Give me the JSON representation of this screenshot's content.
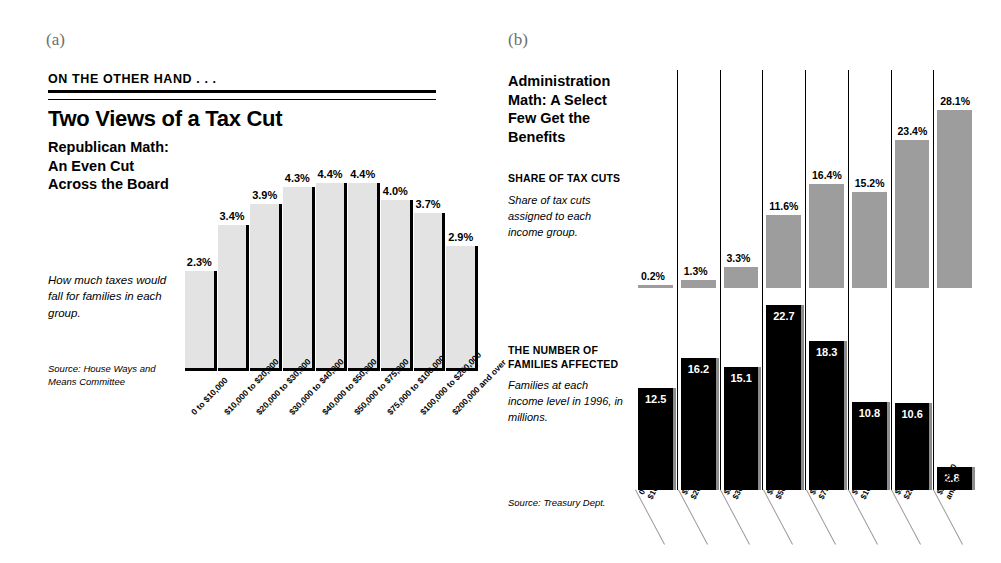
{
  "figure_labels": {
    "a": "(a)",
    "b": "(b)"
  },
  "panel_a": {
    "kicker": "ON THE OTHER HAND . . .",
    "title": "Two Views of a Tax Cut",
    "subhead": "Republican Math: An Even Cut Across the Board",
    "blurb": "How much taxes would fall for families in each group.",
    "source": "Source: House Ways and Means Committee"
  },
  "panel_b": {
    "title": "Administration Math: A Select Few Get the Benefits",
    "share_label": "SHARE OF TAX CUTS",
    "share_blurb": "Share of tax cuts assigned to each income group.",
    "families_label": "THE NUMBER OF FAMILIES AFFECTED",
    "families_blurb": "Families at each income level in 1996, in millions.",
    "source": "Source: Treasury Dept."
  },
  "chart_data": [
    {
      "type": "bar",
      "title": "Republican Math: An Even Cut Across the Board",
      "xlabel": "",
      "ylabel": "",
      "ylim": [
        0,
        5
      ],
      "grid": false,
      "legend": "none",
      "categories": [
        "0 to $10,000",
        "$10,000 to $20,000",
        "$20,000 to $30,000",
        "$30,000 to $40,000",
        "$40,000 to $50,000",
        "$50,000 to $75,000",
        "$75,000 to $100,000",
        "$100,000 to $200,000",
        "$200,000 and over"
      ],
      "values": [
        2.3,
        3.4,
        3.9,
        4.3,
        4.4,
        4.4,
        4.0,
        3.7,
        2.9
      ],
      "value_labels": [
        "2.3%",
        "3.4%",
        "3.9%",
        "4.3%",
        "4.4%",
        "4.4%",
        "4.0%",
        "3.7%",
        "2.9%"
      ],
      "bar_color": "#e3e3e3"
    },
    {
      "type": "bar",
      "title": "Administration Math: A Select Few Get the Benefits",
      "xlabel": "",
      "ylabel": "",
      "grid": false,
      "legend": "none",
      "categories": [
        "0 to $10,000",
        "$10,000 to $20,000",
        "$20,000 to $30,000",
        "$30,000 to $50,000",
        "$50,000 to $75,000",
        "$75,000 to $100,000",
        "$100,000 to $200,000",
        "$200,000 and over"
      ],
      "category_lines": [
        [
          "0 to",
          "$10,000"
        ],
        [
          "$10,000 to",
          "$20,000"
        ],
        [
          "$20,000 to",
          "$30,000"
        ],
        [
          "$30,000 to",
          "$50,000"
        ],
        [
          "$50,000 to",
          "$75,000"
        ],
        [
          "$75,000 to",
          "$100,000"
        ],
        [
          "$100,000 to",
          "$200,000"
        ],
        [
          "$200,000",
          "and over"
        ]
      ],
      "series": [
        {
          "name": "SHARE OF TAX CUTS",
          "unit": "percent",
          "orientation": "hanging-from-top",
          "values": [
            0.2,
            1.3,
            3.3,
            11.6,
            16.4,
            15.2,
            23.4,
            28.1
          ],
          "value_labels": [
            "0.2%",
            "1.3%",
            "3.3%",
            "11.6%",
            "16.4%",
            "15.2%",
            "23.4%",
            "28.1%"
          ],
          "ylim": [
            0,
            30
          ],
          "color": "#9d9d9d"
        },
        {
          "name": "THE NUMBER OF FAMILIES AFFECTED",
          "unit": "millions",
          "orientation": "rising-from-bottom",
          "values": [
            12.5,
            16.2,
            15.1,
            22.7,
            18.3,
            10.8,
            10.6,
            2.8
          ],
          "value_labels": [
            "12.5",
            "16.2",
            "15.1",
            "22.7",
            "18.3",
            "10.8",
            "10.6",
            "2.8"
          ],
          "ylim": [
            0,
            24
          ],
          "color": "#000000"
        }
      ]
    }
  ]
}
